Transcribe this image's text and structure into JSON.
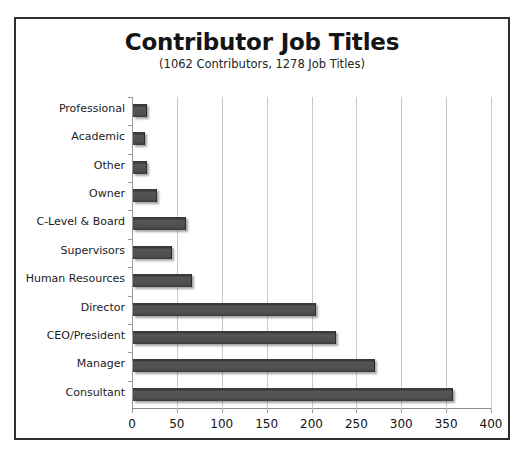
{
  "chart_data": {
    "type": "bar",
    "orientation": "horizontal",
    "title": "Contributor Job Titles",
    "subtitle": "(1062 Contributors, 1278 Job Titles)",
    "categories": [
      "Professional",
      "Academic",
      "Other",
      "Owner",
      "C-Level & Board",
      "Supervisors",
      "Human Resources",
      "Director",
      "CEO/President",
      "Manager",
      "Consultant"
    ],
    "values": [
      14,
      12,
      14,
      26,
      58,
      42,
      65,
      203,
      225,
      268,
      355
    ],
    "xlabel": "",
    "ylabel": "",
    "xlim": [
      0,
      400
    ],
    "xticks": [
      0,
      50,
      100,
      150,
      200,
      250,
      300,
      350,
      400
    ],
    "xtick_labels": [
      "0",
      "50",
      "100",
      "150",
      "200",
      "250",
      "300",
      "350",
      "400"
    ],
    "grid": "vertical",
    "legend": "none",
    "bar_color": "#4f4f4f",
    "grid_color": "#c9c9c9",
    "border_color": "#2e2e2e",
    "background_color": "#ffffff"
  }
}
